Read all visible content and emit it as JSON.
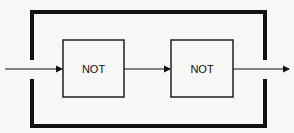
{
  "diagram": {
    "title": "",
    "blocks": [
      {
        "id": "not1",
        "label": "NOT"
      },
      {
        "id": "not2",
        "label": "NOT"
      }
    ],
    "connections": [
      {
        "from": "input",
        "to": "not1"
      },
      {
        "from": "not1",
        "to": "not2"
      },
      {
        "from": "not2",
        "to": "output"
      }
    ],
    "enclosure": "outer-frame",
    "colors": {
      "line": "#111111",
      "background": "#f7f7f5"
    }
  }
}
